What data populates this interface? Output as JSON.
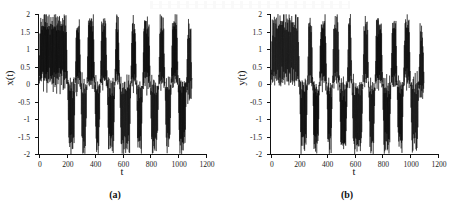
{
  "figure": {
    "panels": [
      {
        "caption": "(a)",
        "ylabel": "x(t)",
        "xlabel": "t",
        "series_key": "x"
      },
      {
        "caption": "(b)",
        "ylabel": "y(t)",
        "xlabel": "t",
        "series_key": "y"
      }
    ]
  },
  "chart_data": [
    {
      "type": "line",
      "title": "",
      "subtitle": "",
      "xlabel": "t",
      "ylabel": "x(t)",
      "xlim": [
        0,
        1200
      ],
      "ylim": [
        -2,
        2
      ],
      "xticks": [
        0,
        200,
        400,
        600,
        800,
        1000,
        1200
      ],
      "xtick_labels": [
        "0",
        "200",
        "400",
        "600",
        "800",
        "1000",
        "1200"
      ],
      "yticks": [
        -2,
        -1.5,
        -1,
        -0.5,
        0,
        0.5,
        1,
        1.5,
        2
      ],
      "ytick_labels": [
        "-2",
        "-1.5",
        "-1",
        "-0.5",
        "0",
        "0.5",
        "1",
        "1.5",
        "2"
      ],
      "grid": false,
      "legend": null,
      "legend_position": "none",
      "line_color": "#000000",
      "line_width": 0.45,
      "data_extent_x": [
        0,
        1100
      ],
      "description": "Dense chaotic oscillation of a double-well (bistable) system; rapid oscillations with amplitude near +/-2 intermittently switching between a positive lobe centered near +1 and a negative lobe centered near -1.",
      "series": [
        {
          "name": "x(t)",
          "regime_segments": [
            {
              "t_start": 0,
              "t_end": 205,
              "center": 0.95,
              "amplitude": 1.05
            },
            {
              "t_start": 205,
              "t_end": 260,
              "center": -0.85,
              "amplitude": 1.05
            },
            {
              "t_start": 260,
              "t_end": 300,
              "center": 0.9,
              "amplitude": 1.05
            },
            {
              "t_start": 300,
              "t_end": 345,
              "center": -0.9,
              "amplitude": 1.05
            },
            {
              "t_start": 345,
              "t_end": 400,
              "center": 0.9,
              "amplitude": 1.05
            },
            {
              "t_start": 400,
              "t_end": 440,
              "center": -0.9,
              "amplitude": 1.05
            },
            {
              "t_start": 440,
              "t_end": 490,
              "center": 0.9,
              "amplitude": 1.05
            },
            {
              "t_start": 490,
              "t_end": 545,
              "center": -0.9,
              "amplitude": 1.05
            },
            {
              "t_start": 545,
              "t_end": 580,
              "center": 0.9,
              "amplitude": 1.05
            },
            {
              "t_start": 580,
              "t_end": 660,
              "center": -0.9,
              "amplitude": 1.05
            },
            {
              "t_start": 660,
              "t_end": 700,
              "center": 0.9,
              "amplitude": 1.05
            },
            {
              "t_start": 700,
              "t_end": 745,
              "center": -0.9,
              "amplitude": 1.05
            },
            {
              "t_start": 745,
              "t_end": 800,
              "center": 0.9,
              "amplitude": 1.05
            },
            {
              "t_start": 800,
              "t_end": 860,
              "center": -0.9,
              "amplitude": 1.05
            },
            {
              "t_start": 860,
              "t_end": 905,
              "center": 0.9,
              "amplitude": 1.05
            },
            {
              "t_start": 905,
              "t_end": 950,
              "center": -0.85,
              "amplitude": 1.05
            },
            {
              "t_start": 950,
              "t_end": 1000,
              "center": 0.9,
              "amplitude": 1.05
            },
            {
              "t_start": 1000,
              "t_end": 1060,
              "center": -0.85,
              "amplitude": 1.05
            },
            {
              "t_start": 1060,
              "t_end": 1100,
              "center": 0.6,
              "amplitude": 1.2
            }
          ]
        }
      ]
    },
    {
      "type": "line",
      "title": "",
      "subtitle": "",
      "xlabel": "t",
      "ylabel": "y(t)",
      "xlim": [
        0,
        1200
      ],
      "ylim": [
        -2,
        2
      ],
      "xticks": [
        0,
        200,
        400,
        600,
        800,
        1000,
        1200
      ],
      "xtick_labels": [
        "0",
        "200",
        "400",
        "600",
        "800",
        "1000",
        "1200"
      ],
      "yticks": [
        -2,
        -1.5,
        -1,
        -0.5,
        0,
        0.5,
        1,
        1.5,
        2
      ],
      "ytick_labels": [
        "-2",
        "-1.5",
        "-1",
        "-0.5",
        "0",
        "0.5",
        "1",
        "1.5",
        "2"
      ],
      "grid": false,
      "legend": null,
      "legend_position": "none",
      "line_color": "#000000",
      "line_width": 0.45,
      "data_extent_x": [
        0,
        1100
      ],
      "description": "Synchronized chaotic response y(t) closely tracking x(t); same intermittent switching between positive and negative lobes over t in [0,1100].",
      "series": [
        {
          "name": "y(t)",
          "regime_segments": [
            {
              "t_start": 0,
              "t_end": 205,
              "center": 0.95,
              "amplitude": 1.05
            },
            {
              "t_start": 205,
              "t_end": 262,
              "center": -0.85,
              "amplitude": 1.05
            },
            {
              "t_start": 262,
              "t_end": 300,
              "center": 0.9,
              "amplitude": 1.05
            },
            {
              "t_start": 300,
              "t_end": 348,
              "center": -0.9,
              "amplitude": 1.05
            },
            {
              "t_start": 348,
              "t_end": 400,
              "center": 0.9,
              "amplitude": 1.05
            },
            {
              "t_start": 400,
              "t_end": 442,
              "center": -0.9,
              "amplitude": 1.05
            },
            {
              "t_start": 442,
              "t_end": 492,
              "center": 0.9,
              "amplitude": 1.05
            },
            {
              "t_start": 492,
              "t_end": 548,
              "center": -0.9,
              "amplitude": 1.05
            },
            {
              "t_start": 548,
              "t_end": 582,
              "center": 0.9,
              "amplitude": 1.05
            },
            {
              "t_start": 582,
              "t_end": 660,
              "center": -0.9,
              "amplitude": 1.05
            },
            {
              "t_start": 660,
              "t_end": 702,
              "center": 0.9,
              "amplitude": 1.05
            },
            {
              "t_start": 702,
              "t_end": 748,
              "center": -0.9,
              "amplitude": 1.05
            },
            {
              "t_start": 748,
              "t_end": 802,
              "center": 0.9,
              "amplitude": 1.05
            },
            {
              "t_start": 802,
              "t_end": 862,
              "center": -0.9,
              "amplitude": 1.05
            },
            {
              "t_start": 862,
              "t_end": 906,
              "center": 0.9,
              "amplitude": 1.05
            },
            {
              "t_start": 906,
              "t_end": 952,
              "center": -0.85,
              "amplitude": 1.05
            },
            {
              "t_start": 952,
              "t_end": 1002,
              "center": 0.9,
              "amplitude": 1.05
            },
            {
              "t_start": 1002,
              "t_end": 1062,
              "center": -0.85,
              "amplitude": 1.05
            },
            {
              "t_start": 1062,
              "t_end": 1100,
              "center": 0.6,
              "amplitude": 1.2
            }
          ]
        }
      ]
    }
  ]
}
